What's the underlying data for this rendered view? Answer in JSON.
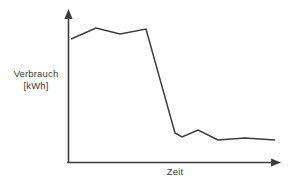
{
  "chart_data": {
    "type": "line",
    "title": "",
    "subtitle": "",
    "xlabel": "Zeit",
    "ylabel_line1": "Verbrauch",
    "ylabel_line2": "[kWh]",
    "ylabel": "Verbrauch [kWh]",
    "grid": false,
    "legend": false,
    "legend_position": "none",
    "axis_arrows": true,
    "tick_labels_x": [],
    "tick_labels_y": [],
    "xlim": [
      0,
      10
    ],
    "ylim": [
      0,
      10
    ],
    "series": [
      {
        "name": "Verbrauch",
        "color": "#3c3c3c",
        "x": [
          0.15,
          1.35,
          2.5,
          3.75,
          5.15,
          5.5,
          6.3,
          7.25,
          8.55,
          10.0
        ],
        "values": [
          8.1,
          8.8,
          8.4,
          8.75,
          1.9,
          1.65,
          2.1,
          1.45,
          1.55,
          1.45
        ]
      }
    ],
    "points_px": [
      [
        71,
        39
      ],
      [
        96,
        28
      ],
      [
        120,
        34
      ],
      [
        146,
        29
      ],
      [
        175,
        133
      ],
      [
        182,
        137
      ],
      [
        198,
        130
      ],
      [
        218,
        140
      ],
      [
        245,
        138
      ],
      [
        275,
        140
      ]
    ],
    "axes_px": {
      "origin": [
        68,
        162
      ],
      "y_top": [
        68,
        10
      ],
      "x_right": [
        280,
        162
      ]
    }
  },
  "colors": {
    "line": "#3c3c3c",
    "axis": "#3c3c3c",
    "background": "#ffffff",
    "text": "#3c3c3c"
  }
}
